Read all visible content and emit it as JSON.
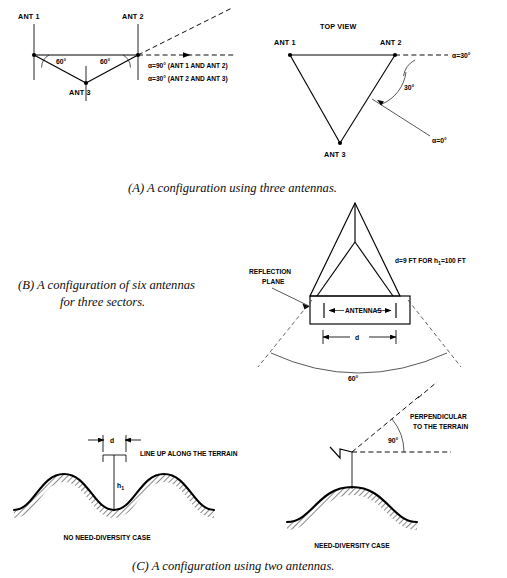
{
  "figure": {
    "background_color": "#ffffff",
    "ink_color": "#000000"
  },
  "panel_a": {
    "caption": "(A)  A configuration using three antennas.",
    "side_view": {
      "view_name": "side-view",
      "antenna_labels": [
        "ANT 1",
        "ANT 2",
        "ANT 3"
      ],
      "angle_labels": [
        "60°",
        "60°"
      ],
      "notes": [
        "α=90° (ANT 1 AND ANT 2)",
        "α=30° (ANT 2 AND ANT 3)"
      ]
    },
    "top_view": {
      "view_title": "TOP VIEW",
      "antenna_labels": [
        "ANT 1",
        "ANT 2",
        "ANT 3"
      ],
      "angle_label": "30°",
      "alpha_reference_label": "α=30°",
      "alpha_zero_label": "α=0°"
    }
  },
  "panel_b": {
    "caption_line1": "(B)  A configuration of six antennas",
    "caption_line2": "for three sectors.",
    "labels": {
      "reflection_plane_line1": "REFLECTION",
      "reflection_plane_line2": "PLANE",
      "antennas": "ANTENNAS",
      "spacing_symbol": "d",
      "sector_angle": "60°"
    },
    "note": {
      "prefix": "d=9 FT FOR h",
      "subscript": "1",
      "suffix": "=100 FT"
    }
  },
  "panel_c": {
    "caption": "(C)  A configuration using two antennas.",
    "left": {
      "case_label": "NO NEED-DIVERSITY CASE",
      "spacing_symbol": "d",
      "height_symbol": "h",
      "height_subscript": "1",
      "note": "LINE UP ALONG THE TERRAIN"
    },
    "right": {
      "case_label": "NEED-DIVERSITY CASE",
      "angle_label": "90°",
      "note_line1": "PERPENDICULAR",
      "note_line2": "TO THE TERRAIN"
    }
  }
}
